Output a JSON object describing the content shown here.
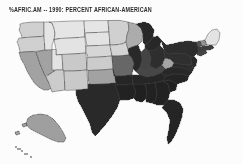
{
  "figure": {
    "title": "%AFRIC.AM -- 1990: PERCENT AFRICAN-AMERICAN",
    "background_color": "#fcfcfc"
  },
  "chart_data": {
    "type": "map",
    "map_kind": "choropleth",
    "region": "United States",
    "title": "%AFRIC.AM -- 1990: PERCENT AFRICAN-AMERICAN",
    "subtitle": "",
    "xlabel": "",
    "ylabel": "",
    "variable": "Percent African-American",
    "year": "1990",
    "color_scheme": "grayscale",
    "legend": "none",
    "grid": false,
    "shade_levels": [
      {
        "level": 1,
        "label": "lowest",
        "color": "#e6e6e6"
      },
      {
        "level": 2,
        "label": "low",
        "color": "#cdcdcd"
      },
      {
        "level": 3,
        "label": "medium",
        "color": "#a8a8a8"
      },
      {
        "level": 4,
        "label": "high",
        "color": "#6e6e6e"
      },
      {
        "level": 5,
        "label": "highest",
        "color": "#1a1a1a"
      }
    ],
    "units": "percent",
    "states": [
      {
        "code": "WA",
        "name": "Washington",
        "level": 2,
        "color": "#cdcdcd"
      },
      {
        "code": "OR",
        "name": "Oregon",
        "level": 2,
        "color": "#cdcdcd"
      },
      {
        "code": "CA",
        "name": "California",
        "level": 3,
        "color": "#9d9d9d"
      },
      {
        "code": "NV",
        "name": "Nevada",
        "level": 3,
        "color": "#9d9d9d"
      },
      {
        "code": "ID",
        "name": "Idaho",
        "level": 1,
        "color": "#e4e4e4"
      },
      {
        "code": "MT",
        "name": "Montana",
        "level": 1,
        "color": "#e4e4e4"
      },
      {
        "code": "WY",
        "name": "Wyoming",
        "level": 1,
        "color": "#e2e2e2"
      },
      {
        "code": "UT",
        "name": "Utah",
        "level": 1,
        "color": "#e2e2e2"
      },
      {
        "code": "AZ",
        "name": "Arizona",
        "level": 2,
        "color": "#c9c9c9"
      },
      {
        "code": "CO",
        "name": "Colorado",
        "level": 2,
        "color": "#c6c6c6"
      },
      {
        "code": "NM",
        "name": "New Mexico",
        "level": 2,
        "color": "#c6c6c6"
      },
      {
        "code": "ND",
        "name": "North Dakota",
        "level": 1,
        "color": "#e4e4e4"
      },
      {
        "code": "SD",
        "name": "South Dakota",
        "level": 1,
        "color": "#e2e2e2"
      },
      {
        "code": "NE",
        "name": "Nebraska",
        "level": 2,
        "color": "#d4d4d4"
      },
      {
        "code": "KS",
        "name": "Kansas",
        "level": 2,
        "color": "#c9c9c9"
      },
      {
        "code": "OK",
        "name": "Oklahoma",
        "level": 3,
        "color": "#9d9d9d"
      },
      {
        "code": "TX",
        "name": "Texas",
        "level": 5,
        "color": "#1e1e1e"
      },
      {
        "code": "MN",
        "name": "Minnesota",
        "level": 2,
        "color": "#cdcdcd"
      },
      {
        "code": "IA",
        "name": "Iowa",
        "level": 2,
        "color": "#d2d2d2"
      },
      {
        "code": "MO",
        "name": "Missouri",
        "level": 4,
        "color": "#5f5f5f"
      },
      {
        "code": "AR",
        "name": "Arkansas",
        "level": 5,
        "color": "#1a1a1a"
      },
      {
        "code": "LA",
        "name": "Louisiana",
        "level": 5,
        "color": "#161616"
      },
      {
        "code": "WI",
        "name": "Wisconsin",
        "level": 3,
        "color": "#a8a8a8"
      },
      {
        "code": "IL",
        "name": "Illinois",
        "level": 5,
        "color": "#1e1e1e"
      },
      {
        "code": "MI",
        "name": "Michigan",
        "level": 5,
        "color": "#1c1c1c"
      },
      {
        "code": "IN",
        "name": "Indiana",
        "level": 4,
        "color": "#3a3a3a"
      },
      {
        "code": "OH",
        "name": "Ohio",
        "level": 5,
        "color": "#232323"
      },
      {
        "code": "KY",
        "name": "Kentucky",
        "level": 4,
        "color": "#3d3d3d"
      },
      {
        "code": "TN",
        "name": "Tennessee",
        "level": 5,
        "color": "#1a1a1a"
      },
      {
        "code": "MS",
        "name": "Mississippi",
        "level": 5,
        "color": "#141414"
      },
      {
        "code": "AL",
        "name": "Alabama",
        "level": 5,
        "color": "#161616"
      },
      {
        "code": "GA",
        "name": "Georgia",
        "level": 5,
        "color": "#161616"
      },
      {
        "code": "FL",
        "name": "Florida",
        "level": 5,
        "color": "#191919"
      },
      {
        "code": "SC",
        "name": "South Carolina",
        "level": 5,
        "color": "#151515"
      },
      {
        "code": "NC",
        "name": "North Carolina",
        "level": 5,
        "color": "#181818"
      },
      {
        "code": "VA",
        "name": "Virginia",
        "level": 5,
        "color": "#1c1c1c"
      },
      {
        "code": "WV",
        "name": "West Virginia",
        "level": 3,
        "color": "#a0a0a0"
      },
      {
        "code": "MD",
        "name": "Maryland",
        "level": 5,
        "color": "#1e1e1e"
      },
      {
        "code": "DE",
        "name": "Delaware",
        "level": 5,
        "color": "#202020"
      },
      {
        "code": "PA",
        "name": "Pennsylvania",
        "level": 5,
        "color": "#242424"
      },
      {
        "code": "NJ",
        "name": "New Jersey",
        "level": 5,
        "color": "#1e1e1e"
      },
      {
        "code": "NY",
        "name": "New York",
        "level": 5,
        "color": "#222222"
      },
      {
        "code": "CT",
        "name": "Connecticut",
        "level": 4,
        "color": "#3a3a3a"
      },
      {
        "code": "RI",
        "name": "Rhode Island",
        "level": 4,
        "color": "#3a3a3a"
      },
      {
        "code": "MA",
        "name": "Massachusetts",
        "level": 4,
        "color": "#343434"
      },
      {
        "code": "VT",
        "name": "Vermont",
        "level": 4,
        "color": "#4a4a4a"
      },
      {
        "code": "NH",
        "name": "New Hampshire",
        "level": 3,
        "color": "#8d8d8d"
      },
      {
        "code": "ME",
        "name": "Maine",
        "level": 1,
        "color": "#e2e2e2"
      },
      {
        "code": "AK",
        "name": "Alaska",
        "level": 3,
        "color": "#9a9a9a"
      },
      {
        "code": "HI",
        "name": "Hawaii",
        "level": 3,
        "color": "#9a9a9a"
      }
    ]
  }
}
